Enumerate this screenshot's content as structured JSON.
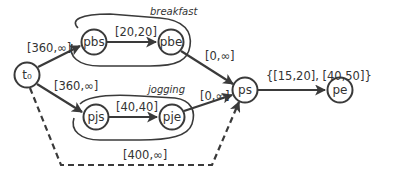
{
  "diagram": {
    "colors": {
      "stroke": "#3a3a3a",
      "text": "#333333",
      "background": "#ffffff"
    },
    "nodes": [
      {
        "id": "t0",
        "label": "t₀",
        "x": 27,
        "y": 75
      },
      {
        "id": "pbs",
        "label": "pbs",
        "x": 94,
        "y": 42
      },
      {
        "id": "pbe",
        "label": "pbe",
        "x": 171,
        "y": 42
      },
      {
        "id": "pjs",
        "label": "pjs",
        "x": 96,
        "y": 117
      },
      {
        "id": "pje",
        "label": "pje",
        "x": 172,
        "y": 117
      },
      {
        "id": "ps",
        "label": "ps",
        "x": 245,
        "y": 90
      },
      {
        "id": "pe",
        "label": "pe",
        "x": 340,
        "y": 90
      }
    ],
    "groups": [
      {
        "id": "breakfast",
        "label": "breakfast"
      },
      {
        "id": "jogging",
        "label": "jogging"
      }
    ],
    "edges": [
      {
        "from": "t0",
        "to": "pbs",
        "label": "[360,∞]",
        "style": "solid"
      },
      {
        "from": "pbs",
        "to": "pbe",
        "label": "[20,20]",
        "style": "solid"
      },
      {
        "from": "pbe",
        "to": "ps",
        "label": "[0,∞]",
        "style": "solid"
      },
      {
        "from": "t0",
        "to": "pjs",
        "label": "[360,∞]",
        "style": "solid"
      },
      {
        "from": "pjs",
        "to": "pje",
        "label": "[40,40]",
        "style": "solid"
      },
      {
        "from": "pje",
        "to": "ps",
        "label": "[0,∞]",
        "style": "solid"
      },
      {
        "from": "ps",
        "to": "pe",
        "label": "{[15,20], [40,50]}",
        "style": "solid"
      },
      {
        "from": "t0",
        "to": "ps",
        "label": "[400,∞]",
        "style": "dashed"
      }
    ]
  }
}
